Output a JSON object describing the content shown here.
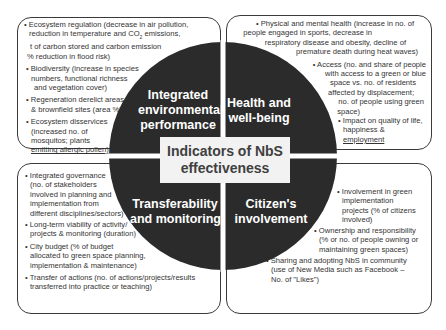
{
  "center": {
    "line1": "Indicators of NbS",
    "line2": "effectiveness"
  },
  "colors": {
    "circle": "#2b2b2b",
    "divider": "#ffffff",
    "box_border": "#3a3a3a",
    "center_bg": "#f2f2f2",
    "text": "#333333"
  },
  "quadrants": {
    "environment": {
      "label_lines": [
        "Integrated",
        "environmental",
        "performance"
      ],
      "bullets": [
        {
          "lines": [
            "• Ecosystem regulation (decrease in air pollution,",
            "reduction in temperature and CO2 emissions,",
            "t of carbon stored and carbon emission",
            "% reduction in flood risk)"
          ]
        },
        {
          "lines": [
            "• Biodiversity (increase in species",
            "numbers, functional richness",
            "and vegetation cover)"
          ]
        },
        {
          "lines": [
            "• Regeneration derelict areas",
            "& brownfield sites (area %)"
          ]
        },
        {
          "lines": [
            "• Ecosystem disservices",
            "(increased no. of",
            "mosquitos; plants",
            "emitting allergic pollen)"
          ]
        }
      ]
    },
    "health": {
      "label_lines": [
        "Health and",
        "well-being"
      ],
      "bullets": [
        {
          "lines": [
            "• Physical and mental health (increase in no. of",
            "people engaged in sports, decrease in",
            "respiratory disease and obesity, decline of",
            "premature death during heat waves)"
          ]
        },
        {
          "lines": [
            "• Access (no. and share of people",
            "with access to a green or blue",
            "space vs. no. of residents",
            "affected by displacement;",
            "no. of people using green",
            "space)"
          ]
        },
        {
          "lines": [
            "• Impact on quality of life,",
            "happiness &",
            "employment"
          ]
        }
      ]
    },
    "transferability": {
      "label_lines": [
        "Transferability",
        "and monitoring"
      ],
      "bullets": [
        {
          "lines": [
            "• Integrated governance",
            "(no. of stakeholders",
            "involved in planning and",
            "implementation from",
            "different disciplines/sectors)"
          ]
        },
        {
          "lines": [
            "• Long-term viability of activity/",
            "projects & monitoring (duration)"
          ]
        },
        {
          "lines": [
            "• City budget (% of budget",
            "allocated to green space planning,",
            "implementation & maintenance)"
          ]
        },
        {
          "lines": [
            "• Transfer of actions (no. of actions/projects/results",
            "transferred into practice or teaching)"
          ]
        }
      ]
    },
    "citizen": {
      "label_lines": [
        "Citizen's",
        "involvement"
      ],
      "bullets": [
        {
          "lines": [
            "• Involvement in green",
            "implementation",
            "projects (% of citizens",
            "involved)"
          ]
        },
        {
          "lines": [
            "• Ownership and responsibility",
            "(%  or no. of people owning or",
            "maintaining green spaces)"
          ]
        },
        {
          "lines": [
            "• Sharing and adopting NbS in community",
            "(use of New Media such as Facebook –",
            "No. of \"Likes\")"
          ]
        }
      ]
    }
  }
}
